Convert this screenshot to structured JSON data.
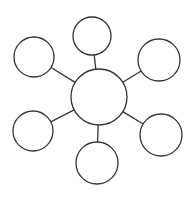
{
  "background": "#ffffff",
  "diagram": {
    "type": "hub-and-spoke",
    "stroke_color": "#333333",
    "stroke_width": 1.3,
    "node_fill": "#ffffff",
    "canvas": {
      "width": 194,
      "height": 198
    },
    "nodes": [
      {
        "id": "hub",
        "cx": 99,
        "cy": 97,
        "r": 28
      },
      {
        "id": "satellite-top",
        "cx": 92,
        "cy": 36,
        "r": 19
      },
      {
        "id": "satellite-upper-right",
        "cx": 159,
        "cy": 60,
        "r": 21
      },
      {
        "id": "satellite-lower-right",
        "cx": 161,
        "cy": 135,
        "r": 21
      },
      {
        "id": "satellite-bottom",
        "cx": 97,
        "cy": 163,
        "r": 21
      },
      {
        "id": "satellite-lower-left",
        "cx": 33,
        "cy": 131,
        "r": 20
      },
      {
        "id": "satellite-upper-left",
        "cx": 34,
        "cy": 57,
        "r": 20
      }
    ],
    "edges": [
      [
        "hub",
        "satellite-top"
      ],
      [
        "hub",
        "satellite-upper-right"
      ],
      [
        "hub",
        "satellite-lower-right"
      ],
      [
        "hub",
        "satellite-bottom"
      ],
      [
        "hub",
        "satellite-lower-left"
      ],
      [
        "hub",
        "satellite-upper-left"
      ]
    ]
  }
}
